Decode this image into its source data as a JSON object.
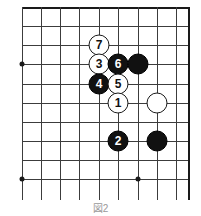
{
  "figure": {
    "type": "go-board-diagram",
    "caption": "図2",
    "board": {
      "grid_spacing_px": 19.3,
      "line_color": "#3c3c3c",
      "edge_color": "#1a1a1a",
      "background_color": "#ffffff",
      "columns_x": [
        22,
        41,
        60,
        79,
        99,
        118,
        138,
        157,
        176,
        188
      ],
      "rows_y": [
        7,
        26,
        45,
        64,
        84,
        103,
        122,
        141,
        160,
        179
      ],
      "edges": {
        "top": 7,
        "right": 188
      },
      "star_points": [
        {
          "x": 22,
          "y": 64
        },
        {
          "x": 22,
          "y": 179
        },
        {
          "x": 138,
          "y": 179
        }
      ]
    },
    "stones": [
      {
        "label": "7",
        "color": "white",
        "x": 99,
        "y": 45
      },
      {
        "label": "3",
        "color": "white",
        "x": 99,
        "y": 64
      },
      {
        "label": "6",
        "color": "black",
        "x": 118,
        "y": 64
      },
      {
        "label": "",
        "color": "black",
        "x": 138,
        "y": 64
      },
      {
        "label": "4",
        "color": "black",
        "x": 99,
        "y": 84
      },
      {
        "label": "5",
        "color": "white",
        "x": 118,
        "y": 84
      },
      {
        "label": "1",
        "color": "white",
        "x": 118,
        "y": 103
      },
      {
        "label": "",
        "color": "white",
        "x": 157,
        "y": 103
      },
      {
        "label": "2",
        "color": "black",
        "x": 118,
        "y": 141
      },
      {
        "label": "",
        "color": "black",
        "x": 157,
        "y": 141
      }
    ]
  }
}
